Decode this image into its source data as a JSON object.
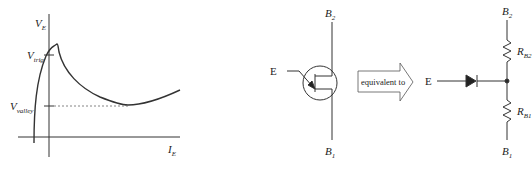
{
  "graph": {
    "y_axis_label": "V",
    "y_axis_sub": "E",
    "x_axis_label": "I",
    "x_axis_sub": "E",
    "v_trig_label": "V",
    "v_trig_sub": "trig",
    "v_valley_label": "V",
    "v_valley_sub": "valley"
  },
  "ujt_symbol": {
    "emitter_label": "E",
    "base2_label": "B",
    "base2_sub": "2",
    "base1_label": "B",
    "base1_sub": "1"
  },
  "arrow": {
    "label": "equivalent to"
  },
  "equivalent_circuit": {
    "emitter_label": "E",
    "base2_label": "B",
    "base2_sub": "2",
    "base1_label": "B",
    "base1_sub": "1",
    "rb2_label": "R",
    "rb2_sub": "B2",
    "rb1_label": "R",
    "rb1_sub": "B1"
  }
}
